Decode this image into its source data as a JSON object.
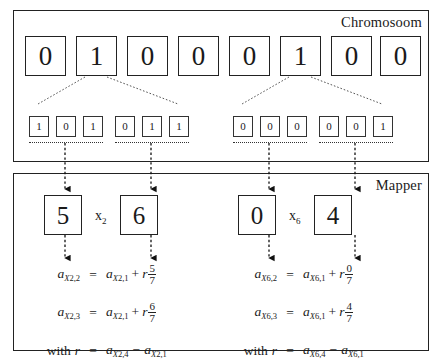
{
  "diagram": {
    "chromosome": {
      "label": "Chromosoom",
      "genes": [
        "0",
        "1",
        "0",
        "0",
        "0",
        "1",
        "0",
        "0"
      ],
      "expansions": [
        {
          "source_gene_index": 1,
          "bits": [
            "1",
            "0",
            "1",
            "0",
            "1",
            "1"
          ],
          "groups": [
            {
              "bits": [
                "1",
                "0",
                "1"
              ],
              "value": "5"
            },
            {
              "bits": [
                "0",
                "1",
                "1"
              ],
              "value": "6"
            }
          ]
        },
        {
          "source_gene_index": 5,
          "bits": [
            "0",
            "0",
            "0",
            "0",
            "0",
            "1"
          ],
          "groups": [
            {
              "bits": [
                "0",
                "0",
                "0"
              ],
              "value": "0"
            },
            {
              "bits": [
                "0",
                "0",
                "1"
              ],
              "value": "4"
            }
          ]
        }
      ]
    },
    "mapper": {
      "label": "Mapper",
      "units": [
        {
          "variable": "x",
          "variable_subscript": "2",
          "left_value": "5",
          "right_value": "6",
          "equations": [
            {
              "lhs_base": "a",
              "lhs_sub": "X",
              "lhs_sub_index": "2",
              "lhs_sub_tail": ",2",
              "eq": "=",
              "rhs_base": "a",
              "rhs_sub": "X",
              "rhs_sub_index": "2",
              "rhs_sub_tail": ",1",
              "plus": "+",
              "coef": "r",
              "num": "5",
              "den": "7"
            },
            {
              "lhs_base": "a",
              "lhs_sub": "X",
              "lhs_sub_index": "2",
              "lhs_sub_tail": ",3",
              "eq": "=",
              "rhs_base": "a",
              "rhs_sub": "X",
              "rhs_sub_index": "2",
              "rhs_sub_tail": ",1",
              "plus": "+",
              "coef": "r",
              "num": "6",
              "den": "7"
            }
          ],
          "with": {
            "text": "with",
            "symbol": "r",
            "eq": "=",
            "term1_base": "a",
            "term1_sub": "X",
            "term1_index": "2",
            "term1_tail": ",4",
            "minus": "−",
            "term2_base": "a",
            "term2_sub": "X",
            "term2_index": "2",
            "term2_tail": ",1"
          }
        },
        {
          "variable": "x",
          "variable_subscript": "6",
          "left_value": "0",
          "right_value": "4",
          "equations": [
            {
              "lhs_base": "a",
              "lhs_sub": "X",
              "lhs_sub_index": "6",
              "lhs_sub_tail": ",2",
              "eq": "=",
              "rhs_base": "a",
              "rhs_sub": "X",
              "rhs_sub_index": "6",
              "rhs_sub_tail": ",1",
              "plus": "+",
              "coef": "r",
              "num": "0",
              "den": "7"
            },
            {
              "lhs_base": "a",
              "lhs_sub": "X",
              "lhs_sub_index": "6",
              "lhs_sub_tail": ",3",
              "eq": "=",
              "rhs_base": "a",
              "rhs_sub": "X",
              "rhs_sub_index": "6",
              "rhs_sub_tail": ",1",
              "plus": "+",
              "coef": "r",
              "num": "4",
              "den": "7"
            }
          ],
          "with": {
            "text": "with",
            "symbol": "r",
            "eq": "=",
            "term1_base": "a",
            "term1_sub": "X",
            "term1_index": "6",
            "term1_tail": ",4",
            "minus": "−",
            "term2_base": "a",
            "term2_sub": "X",
            "term2_index": "6",
            "term2_tail": ",1"
          }
        }
      ]
    },
    "colors": {
      "ink": "#1a1a1a",
      "border": "#222222",
      "connector": "#333333",
      "background": "#ffffff"
    }
  }
}
